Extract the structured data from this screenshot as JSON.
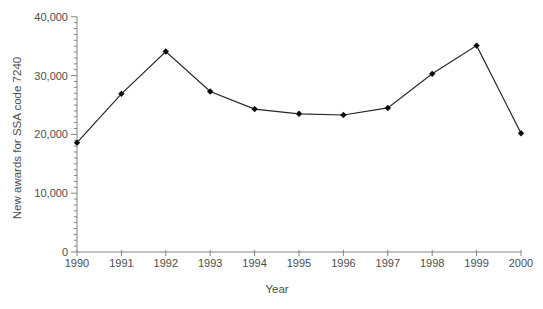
{
  "figure": {
    "background": "#ffffff"
  },
  "chart_data": {
    "type": "line",
    "title": "",
    "xlabel": "Year",
    "ylabel": "New awards for SSA code 7240",
    "x": [
      1990,
      1991,
      1992,
      1993,
      1994,
      1995,
      1996,
      1997,
      1998,
      1999,
      2000
    ],
    "values": [
      18600,
      26900,
      34100,
      27300,
      24300,
      23500,
      23300,
      24500,
      30300,
      35100,
      20200
    ],
    "series_name": "New awards",
    "ylim": [
      0,
      40000
    ],
    "y_major_ticks": [
      {
        "value": 0,
        "label": "0"
      },
      {
        "value": 10000,
        "label": "10,000"
      },
      {
        "value": 20000,
        "label": "20,000"
      },
      {
        "value": 30000,
        "label": "30,000"
      },
      {
        "value": 40000,
        "label": "40,000"
      }
    ],
    "y_minor_tick_step": 1000,
    "x_tick_labels": [
      "1990",
      "1991",
      "1992",
      "1993",
      "1994",
      "1995",
      "1996",
      "1997",
      "1998",
      "1999",
      "2000"
    ],
    "grid": "off",
    "legend": "none",
    "marker": "diamond",
    "line_color": "#262626",
    "marker_color": "#0d0d0d",
    "axis_color": "#848484",
    "label_color": "#4d4d4d"
  }
}
